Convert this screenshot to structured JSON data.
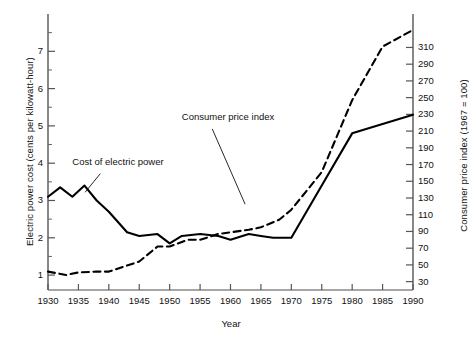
{
  "chart_data": {
    "type": "line",
    "title": "",
    "xlabel": "Year",
    "ylabel": "Electric power cost (cents per kilowatt-hour)",
    "ylabel_right": "Consumer price index (1967 = 100)",
    "xlim": [
      1930,
      1990
    ],
    "xticks": [
      1930,
      1935,
      1940,
      1945,
      1950,
      1955,
      1960,
      1965,
      1970,
      1975,
      1980,
      1985,
      1990
    ],
    "ylim_left": [
      0.6,
      8.0
    ],
    "yticks_left": [
      1,
      2,
      3,
      4,
      5,
      6,
      7
    ],
    "yticks_left_labels": [
      "1",
      "2",
      "3",
      "4",
      "5",
      "6",
      "7"
    ],
    "ylim_right": [
      20,
      350
    ],
    "yticks_right": [
      30,
      50,
      70,
      90,
      110,
      130,
      150,
      170,
      190,
      210,
      230,
      250,
      270,
      290,
      310
    ],
    "yticks_right_labels": [
      "30",
      "50",
      "70",
      "90",
      "110",
      "130",
      "150",
      "170",
      "190",
      "210",
      "230",
      "250",
      "270",
      "290",
      "310"
    ],
    "grid": false,
    "legend_position": "inline-annotations",
    "series": [
      {
        "name": "Cost of electric power",
        "style": "solid",
        "axis": "left",
        "x": [
          1930,
          1932,
          1934,
          1936,
          1938,
          1940,
          1943,
          1945,
          1948,
          1950,
          1952,
          1955,
          1958,
          1960,
          1963,
          1965,
          1967,
          1970,
          1975,
          1980,
          1985,
          1990
        ],
        "values": [
          3.1,
          3.35,
          3.1,
          3.4,
          3.0,
          2.7,
          2.15,
          2.05,
          2.1,
          1.85,
          2.05,
          2.1,
          2.05,
          1.95,
          2.1,
          2.05,
          2.0,
          2.0,
          3.4,
          4.8,
          5.05,
          5.3
        ]
      },
      {
        "name": "Consumer price index",
        "style": "dashed",
        "axis": "right",
        "x": [
          1930,
          1933,
          1935,
          1938,
          1940,
          1945,
          1948,
          1950,
          1953,
          1955,
          1958,
          1960,
          1963,
          1965,
          1968,
          1970,
          1975,
          1980,
          1985,
          1990
        ],
        "values": [
          42,
          38,
          41,
          42,
          42,
          54,
          72,
          72,
          80,
          80,
          87,
          89,
          92,
          95,
          104,
          116,
          161,
          247,
          311,
          331
        ]
      }
    ],
    "annotations": [
      {
        "text": "Cost of electric power",
        "x": 1934,
        "y": 4.0
      },
      {
        "text": "Consumer price index",
        "x": 1952,
        "y": 5.2
      }
    ],
    "colors": {
      "line": "#000000",
      "axis": "#444444",
      "text": "#111111"
    }
  }
}
